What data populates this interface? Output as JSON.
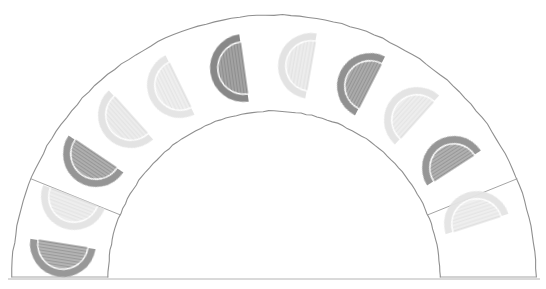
{
  "figure": {
    "title": "Lunar phase arc",
    "style": "pencil-sketch",
    "background_color": "#ffffff",
    "stroke_color": "#9a9a9a",
    "stroke_color_dark": "#6f6f6f",
    "canvas": {
      "width": 546,
      "height": 289
    }
  },
  "arc_band": {
    "name": "semicircular-band",
    "center_x": 274,
    "center_y": 277,
    "outer_radius": 262,
    "inner_radius": 166,
    "start_angle_deg": 180,
    "end_angle_deg": 360,
    "fill": "#ffffff",
    "outline_color": "#8f8f8f",
    "outline_width": 1.1,
    "baseline_y": 277,
    "baseline_color": "#b4b4b4"
  },
  "dividers": {
    "name": "radial-divider-lines",
    "color": "#9a9a9a",
    "width": 0.9,
    "angles_deg": [
      180,
      202,
      338,
      360
    ]
  },
  "chart_data": {
    "type": "scatter",
    "title": "Lunar phase arc",
    "xlabel": "",
    "ylabel": "",
    "layout": "semicircular band, phases placed along mid-radius arc",
    "mid_radius": 214,
    "legend": "none",
    "grid": false,
    "categories": [
      "Waning Crescent",
      "Waning Gibbous",
      "Last Quarter",
      "Waxing Gibbous",
      "Waxing Crescent",
      "Full Moon",
      "Waning Crescent",
      "Waning Gibbous",
      "Last Quarter",
      "Waxing Gibbous",
      "New Moon"
    ],
    "values": [
      0.72,
      0.16,
      0.74,
      0.18,
      0.78,
      0.9,
      0.2,
      0.8,
      0.18,
      0.74,
      0.14
    ],
    "points": [
      {
        "index": 0,
        "label": "phase-1",
        "angle_deg": 189,
        "x": 63,
        "y": 244,
        "radius": 33,
        "tone": "dark",
        "fill": "#a3a3a3",
        "rim": "#8d8d8d",
        "hatch": true,
        "orientation_deg": 99
      },
      {
        "index": 1,
        "label": "phase-2",
        "angle_deg": 201,
        "x": 74,
        "y": 197,
        "radius": 33,
        "tone": "light",
        "fill": "#ececec",
        "rim": "#e3e3e3",
        "hatch": true,
        "orientation_deg": 111
      },
      {
        "index": 2,
        "label": "phase-3",
        "angle_deg": 214,
        "x": 96,
        "y": 154,
        "radius": 33,
        "tone": "dark",
        "fill": "#9d9d9d",
        "rim": "#8a8a8a",
        "hatch": true,
        "orientation_deg": 124
      },
      {
        "index": 3,
        "label": "phase-4",
        "angle_deg": 228,
        "x": 131,
        "y": 115,
        "radius": 33,
        "tone": "light",
        "fill": "#eaeaea",
        "rim": "#e1e1e1",
        "hatch": true,
        "orientation_deg": 138
      },
      {
        "index": 4,
        "label": "phase-5",
        "angle_deg": 244,
        "x": 180,
        "y": 85,
        "radius": 33,
        "tone": "light",
        "fill": "#ededed",
        "rim": "#e4e4e4",
        "hatch": true,
        "orientation_deg": 154
      },
      {
        "index": 5,
        "label": "phase-6",
        "angle_deg": 262,
        "x": 244,
        "y": 68,
        "radius": 34,
        "tone": "dark",
        "fill": "#8f8f8f",
        "rim": "#7c7c7c",
        "hatch": true,
        "orientation_deg": 172
      },
      {
        "index": 6,
        "label": "phase-7",
        "angle_deg": 280,
        "x": 311,
        "y": 66,
        "radius": 33,
        "tone": "light",
        "fill": "#ebebeb",
        "rim": "#e2e2e2",
        "hatch": true,
        "orientation_deg": 190
      },
      {
        "index": 7,
        "label": "phase-8",
        "angle_deg": 297,
        "x": 370,
        "y": 86,
        "radius": 33,
        "tone": "dark",
        "fill": "#9a9a9a",
        "rim": "#858585",
        "hatch": true,
        "orientation_deg": 207
      },
      {
        "index": 8,
        "label": "phase-9",
        "angle_deg": 312,
        "x": 417,
        "y": 120,
        "radius": 33,
        "tone": "light",
        "fill": "#ececec",
        "rim": "#e3e3e3",
        "hatch": true,
        "orientation_deg": 222
      },
      {
        "index": 9,
        "label": "phase-10",
        "angle_deg": 327,
        "x": 454,
        "y": 168,
        "radius": 32,
        "tone": "dark",
        "fill": "#a0a0a0",
        "rim": "#8b8b8b",
        "hatch": true,
        "orientation_deg": 237
      },
      {
        "index": 10,
        "label": "phase-11",
        "angle_deg": 342,
        "x": 477,
        "y": 224,
        "radius": 33,
        "tone": "light",
        "fill": "#ededed",
        "rim": "#e4e4e4",
        "hatch": true,
        "orientation_deg": 252
      }
    ]
  }
}
